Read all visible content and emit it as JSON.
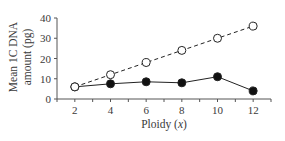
{
  "chart_data": {
    "type": "line",
    "title": "",
    "xlabel": "Ploidy (x)",
    "xlabel_parts": {
      "text": "Ploidy (",
      "var": "x",
      "close": ")"
    },
    "ylabel_lines": [
      "Mean 1C DNA",
      "amount (pg)"
    ],
    "ylabel": "Mean 1C DNA amount (pg)",
    "x": [
      2,
      4,
      6,
      8,
      10,
      12
    ],
    "xticks": [
      2,
      4,
      6,
      8,
      10,
      12
    ],
    "yticks": [
      0,
      10,
      20,
      30,
      40
    ],
    "xlim": [
      1,
      13
    ],
    "ylim": [
      0,
      40
    ],
    "grid": false,
    "legend": null,
    "series": [
      {
        "name": "expected (open circles, dashed)",
        "marker": "open-circle",
        "line": "dashed",
        "values": [
          6,
          12,
          18,
          24,
          30,
          36
        ]
      },
      {
        "name": "observed (filled circles, solid)",
        "marker": "filled-circle",
        "line": "solid",
        "values": [
          6,
          7.5,
          8.5,
          8,
          11,
          4
        ]
      }
    ]
  },
  "colors": {
    "axis": "#555555",
    "line": "#222222",
    "text": "#3a3a3a"
  }
}
